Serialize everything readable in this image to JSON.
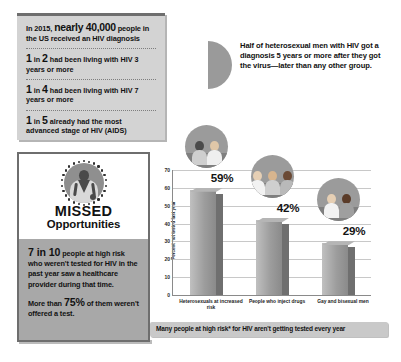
{
  "stats_panel": {
    "lead_prefix": "In 2015,",
    "lead_big": "nearly 40,000",
    "lead_suffix": "people in the US received an HIV diagnosis",
    "rows": [
      {
        "num1": "1",
        "mid": "in",
        "num2": "2",
        "text": "had been living with HIV 3 years or more"
      },
      {
        "num1": "1",
        "mid": "in",
        "num2": "4",
        "text": "had been living with HIV 7 years or more"
      },
      {
        "num1": "1",
        "mid": "in",
        "num2": "5",
        "text": "already had the most advanced stage of HIV (AIDS)"
      }
    ]
  },
  "half_callout": {
    "icon": "half-circle-icon",
    "text": "Half of heterosexual men with HIV got a diagnosis 5 years or more after they got the virus—later than any other group."
  },
  "missed_panel": {
    "icon": "doctor-icon",
    "title": "MISSED",
    "subtitle": "Opportunities",
    "paragraph_1_num": "7 in 10",
    "paragraph_1_text": "people at high risk who weren't tested for HIV in the past year saw a healthcare provider during that time.",
    "paragraph_2_prefix": "More than",
    "paragraph_2_num": "75%",
    "paragraph_2_suffix": "of them weren't offered a test."
  },
  "chart_data": {
    "type": "bar",
    "title": "",
    "caption": "Many people at high risk* for HIV aren't getting tested every year",
    "categories": [
      "Heterosexuals at increased risk",
      "People who inject drugs",
      "Gay and bisexual men"
    ],
    "values": [
      59,
      42,
      29
    ],
    "value_labels": [
      "59%",
      "42%",
      "29%"
    ],
    "xlabel": "",
    "ylabel": "Percent not tested last year",
    "ylim": [
      0,
      70
    ],
    "yticks": [
      0,
      10,
      20,
      30,
      40,
      50,
      60,
      70
    ],
    "ytick_labels": [
      "0",
      "10",
      "20",
      "30",
      "40",
      "50",
      "60",
      "70"
    ],
    "grid": true,
    "legend": "none",
    "photo_icons": [
      "heterosexual-couple-photo",
      "people-who-inject-drugs-photo",
      "gay-bisexual-men-photo"
    ]
  },
  "colors": {
    "panel_gray": "#d3d3d3",
    "accent_gray": "#9a9a9a",
    "bar_gray": "#9d9d9d",
    "bar_shadow": "#6f6f6f",
    "caption_gray": "#c9c9c9",
    "text": "#111111"
  }
}
